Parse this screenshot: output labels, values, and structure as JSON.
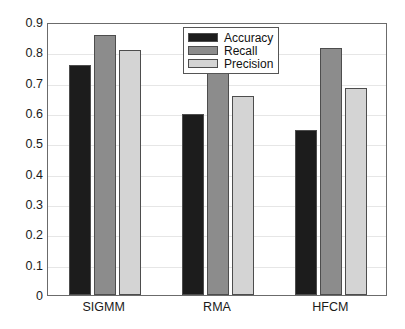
{
  "chart_data": {
    "type": "bar",
    "title": "",
    "xlabel": "",
    "ylabel": "",
    "categories": [
      "SIGMM",
      "RMA",
      "HFCM"
    ],
    "series": [
      {
        "name": "Accuracy",
        "color": "#1c1c1c",
        "values": [
          0.757,
          0.597,
          0.545
        ]
      },
      {
        "name": "Recall",
        "color": "#8c8c8c",
        "values": [
          0.858,
          0.745,
          0.814
        ]
      },
      {
        "name": "Precision",
        "color": "#d4d4d4",
        "values": [
          0.807,
          0.657,
          0.682
        ]
      }
    ],
    "ylim": [
      0,
      0.9
    ],
    "yticks": [
      0,
      0.1,
      0.2,
      0.3,
      0.4,
      0.5,
      0.6,
      0.7,
      0.8,
      0.9
    ],
    "ytick_labels": [
      "0",
      "0.1",
      "0.2",
      "0.3",
      "0.4",
      "0.5",
      "0.6",
      "0.7",
      "0.8",
      "0.9"
    ],
    "grid": true,
    "legend_position": "top-center",
    "axis_color": "#6b6b6b",
    "bar_edge_color": "#4d4d4d"
  },
  "legend": {
    "entries": [
      {
        "label": "Accuracy"
      },
      {
        "label": "Recall"
      },
      {
        "label": "Precision"
      }
    ]
  }
}
